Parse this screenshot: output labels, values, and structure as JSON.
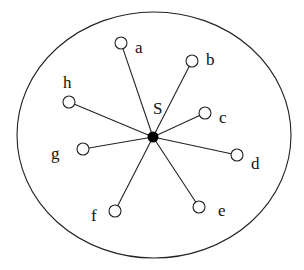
{
  "diagram": {
    "type": "star-topology",
    "boundary": {
      "cx": 154,
      "cy": 135,
      "rx": 137,
      "ry": 123
    },
    "center": {
      "label": "S",
      "x": 153,
      "y": 137,
      "r": 5.5,
      "label_x": 153,
      "label_y": 114
    },
    "nodes": [
      {
        "id": "a",
        "label": "a",
        "x": 121,
        "y": 43,
        "label_x": 135,
        "label_y": 53
      },
      {
        "id": "b",
        "label": "b",
        "x": 192,
        "y": 61,
        "label_x": 206,
        "label_y": 65
      },
      {
        "id": "c",
        "label": "c",
        "x": 205,
        "y": 113,
        "label_x": 219,
        "label_y": 123
      },
      {
        "id": "d",
        "label": "d",
        "x": 237,
        "y": 155,
        "label_x": 251,
        "label_y": 169
      },
      {
        "id": "e",
        "label": "e",
        "x": 199,
        "y": 207,
        "label_x": 218,
        "label_y": 216
      },
      {
        "id": "f",
        "label": "f",
        "x": 115,
        "y": 211,
        "label_x": 91,
        "label_y": 221
      },
      {
        "id": "g",
        "label": "g",
        "x": 83,
        "y": 149,
        "label_x": 51,
        "label_y": 159
      },
      {
        "id": "h",
        "label": "h",
        "x": 69,
        "y": 102,
        "label_x": 63,
        "label_y": 88
      }
    ],
    "node_radius": 6,
    "colors": {
      "stroke": "#222222",
      "center_fill": "#000000",
      "background": "#ffffff"
    }
  }
}
